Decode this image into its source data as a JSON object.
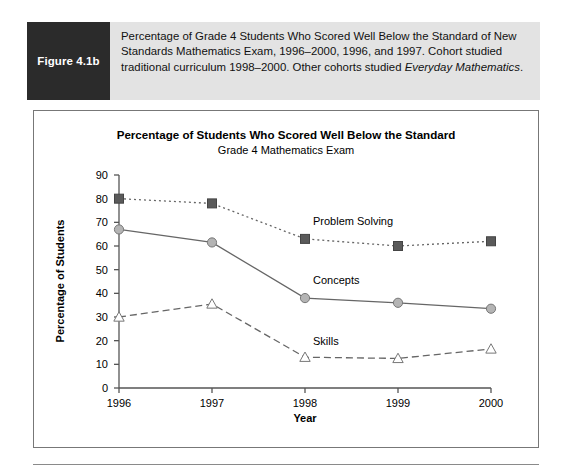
{
  "figure": {
    "label": "Figure 4.1b",
    "caption_part1": "Percentage of Grade 4 Students Who Scored Well Below the Standard of New Standards Mathematics Exam, 1996–2000, 1996, and 1997. Cohort studied traditional curriculum 1998–2000. Other cohorts studied ",
    "caption_italic": "Everyday Mathematics",
    "caption_part2": "."
  },
  "colors": {
    "caption_band": "#e3e3e3",
    "figure_label_box": "#2b2b2b",
    "panel_border": "#777777",
    "problem_solving": "#5a5a5a",
    "concepts": "#b4b4b4",
    "skills": "#ffffff",
    "line": "#666666"
  },
  "chart_data": {
    "type": "line",
    "title": "Percentage of Students Who Scored Well Below the Standard",
    "subtitle": "Grade 4 Mathematics Exam",
    "xlabel": "Year",
    "ylabel": "Percentage of Students",
    "categories": [
      "1996",
      "1997",
      "1998",
      "1999",
      "2000"
    ],
    "x": [
      1996,
      1997,
      1998,
      1999,
      2000
    ],
    "ylim": [
      0,
      90
    ],
    "yticks": [
      0,
      10,
      20,
      30,
      40,
      50,
      60,
      70,
      80,
      90
    ],
    "ytick_labels": [
      "0",
      "10",
      "20",
      "30",
      "40",
      "50",
      "60",
      "70",
      "80",
      "90"
    ],
    "grid": false,
    "legend": "inline-labels",
    "series": [
      {
        "name": "Problem Solving",
        "values": [
          80,
          78,
          63,
          60,
          62
        ],
        "marker": "square-filled",
        "linestyle": "dotted",
        "color": "#5a5a5a"
      },
      {
        "name": "Concepts",
        "values": [
          67,
          61.5,
          38,
          36,
          33.5
        ],
        "marker": "circle-filled",
        "linestyle": "solid",
        "color": "#b4b4b4"
      },
      {
        "name": "Skills",
        "values": [
          30,
          35.5,
          13,
          12.5,
          16.5
        ],
        "marker": "triangle-open",
        "linestyle": "dashed",
        "color": "#ffffff"
      }
    ]
  }
}
